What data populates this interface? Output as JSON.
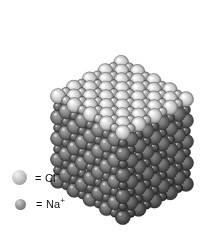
{
  "figure": {
    "background_color": "#ffffff",
    "width": 210,
    "height": 237
  },
  "legend": {
    "items": [
      {
        "name": "chloride-ion",
        "equals_sign": "=",
        "label": "Cl",
        "charge": "−",
        "swatch_diameter": 15,
        "color_light": "#f2f2f2",
        "color_mid": "#c9c9c9",
        "color_dark": "#808080",
        "x": 13,
        "y": 172
      },
      {
        "name": "sodium-ion",
        "equals_sign": "=",
        "label": "Na",
        "charge": "+",
        "swatch_diameter": 11,
        "color_light": "#d0d0d0",
        "color_mid": "#9a9a9a",
        "color_dark": "#5e5e5e",
        "x": 16,
        "y": 200
      }
    ]
  },
  "chart_data": {
    "type": "scatter",
    "xlabel": "",
    "ylabel": "",
    "lattice": {
      "structure": "face-centered cubic rock salt (NaCl)",
      "dimensions": [
        9,
        9,
        9
      ],
      "anion": "Cl-",
      "cation": "Na+",
      "anion_radius_px": 7.6,
      "cation_radius_px": 4.6,
      "cell_spacing_px": 10.4,
      "projection": {
        "ax": [
          8.1,
          4.55
        ],
        "ay": [
          7.9,
          -4.15
        ],
        "az": [
          0.0,
          10.6
        ],
        "origin": [
          58,
          96
        ]
      },
      "shading": {
        "top_face_brightness": 1.0,
        "front_face_brightness": 0.78,
        "right_face_brightness": 0.52,
        "depth_falloff": 0.055
      }
    },
    "legend_entries": [
      "= Cl−",
      "= Na+"
    ],
    "grid": false,
    "legend_position": "lower-left"
  }
}
